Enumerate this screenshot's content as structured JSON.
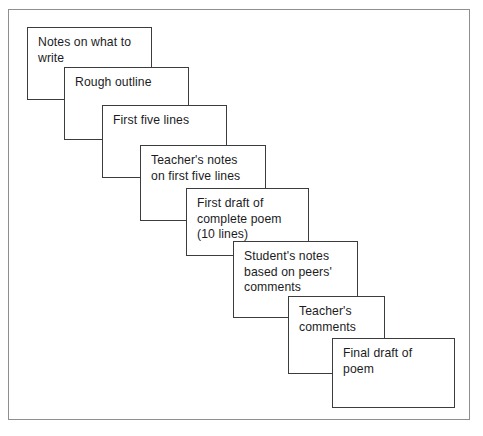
{
  "diagram": {
    "type": "cascading-stack-flow",
    "frame": {
      "border_color": "#8d8f91",
      "background": "#ffffff",
      "x": 8,
      "y": 9,
      "width": 462,
      "height": 411
    },
    "card_style": {
      "border_color": "#3a3c3e",
      "fill_color": "#ffffff",
      "text_color": "#1b1c1e"
    },
    "cards": [
      {
        "id": "notes-on-what-to-write",
        "label": "Notes on what to\nwrite",
        "x": 27,
        "y": 27,
        "width": 125,
        "height": 73
      },
      {
        "id": "rough-outline",
        "label": "Rough outline",
        "x": 64,
        "y": 67,
        "width": 125,
        "height": 73
      },
      {
        "id": "first-five-lines",
        "label": "First five lines",
        "x": 102,
        "y": 105,
        "width": 125,
        "height": 73
      },
      {
        "id": "teachers-notes-on-first-five-lines",
        "label": "Teacher's notes\non first five lines",
        "x": 140,
        "y": 145,
        "width": 126,
        "height": 76
      },
      {
        "id": "first-draft-of-complete-poem",
        "label": "First draft of\ncomplete poem\n(10 lines)",
        "x": 186,
        "y": 188,
        "width": 123,
        "height": 68
      },
      {
        "id": "students-notes-based-on-peers-comments",
        "label": "Student's notes\nbased on peers'\ncomments",
        "x": 233,
        "y": 241,
        "width": 125,
        "height": 77
      },
      {
        "id": "teachers-comments",
        "label": "Teacher's\ncomments",
        "x": 288,
        "y": 296,
        "width": 97,
        "height": 78
      },
      {
        "id": "final-draft-of-poem",
        "label": "Final draft of\npoem",
        "x": 332,
        "y": 338,
        "width": 123,
        "height": 70
      }
    ]
  }
}
